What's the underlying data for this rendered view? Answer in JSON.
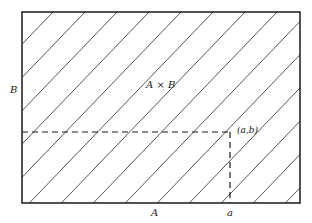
{
  "figure": {
    "type": "cartesian-product-diagram",
    "colors": {
      "background": "#ffffff",
      "stroke": "#1a1a1a",
      "hatch": "#2a2a2a"
    },
    "rectangle": {
      "x": 22,
      "y": 12,
      "width": 278,
      "height": 191
    },
    "hatch": {
      "start_x_on_top": -139,
      "spacing": 32,
      "count": 18,
      "slope": 1.04
    },
    "point": {
      "x": 230,
      "y": 132
    }
  },
  "labels": {
    "product": "A × B",
    "set_b_axis": "B",
    "set_a_axis": "A",
    "coord_a": "a",
    "point": "(a,b)"
  }
}
